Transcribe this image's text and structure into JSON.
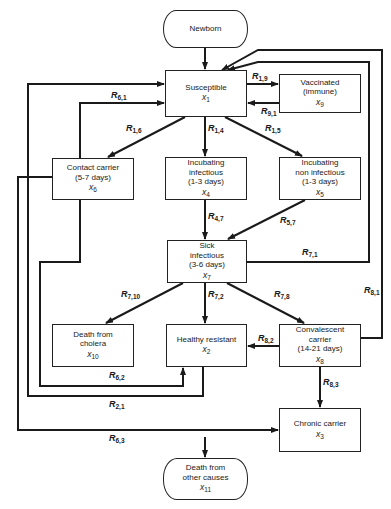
{
  "diagram": {
    "type": "compartment-flow",
    "nodes": [
      {
        "id": "newborn",
        "label": "Newborn",
        "sub": "",
        "var": "",
        "var_sub": ""
      },
      {
        "id": "susceptible",
        "label": "Susceptible",
        "sub": "",
        "var": "x",
        "var_sub": "1"
      },
      {
        "id": "vaccinated",
        "label": "Vaccinated",
        "sub": "(immune)",
        "var": "x",
        "var_sub": "9"
      },
      {
        "id": "contact",
        "label": "Contact carrier",
        "sub": "(5-7 days)",
        "var": "x",
        "var_sub": "6"
      },
      {
        "id": "incub_inf",
        "label": "Incubating",
        "label2": "infectious",
        "sub": "(1-3 days)",
        "var": "x",
        "var_sub": "4"
      },
      {
        "id": "incub_noninf",
        "label": "Incubating",
        "label2": "non infectious",
        "sub": "(1-3 days)",
        "var": "x",
        "var_sub": "5"
      },
      {
        "id": "sick",
        "label": "Sick",
        "label2": "infectious",
        "sub": "(3-6 days)",
        "var": "x",
        "var_sub": "7"
      },
      {
        "id": "death_cholera",
        "label": "Death from",
        "label2": "cholera",
        "sub": "",
        "var": "x",
        "var_sub": "10"
      },
      {
        "id": "healthy",
        "label": "Healthy resistant",
        "sub": "",
        "var": "x",
        "var_sub": "2"
      },
      {
        "id": "convalescent",
        "label": "Convalescent",
        "label2": "carrier",
        "sub": "(14-21 days)",
        "var": "x",
        "var_sub": "8"
      },
      {
        "id": "chronic",
        "label": "Chronic carrier",
        "sub": "",
        "var": "x",
        "var_sub": "3"
      },
      {
        "id": "death_other",
        "label": "Death from",
        "label2": "other causes",
        "sub": "",
        "var": "x",
        "var_sub": "11"
      }
    ],
    "edges": [
      {
        "from": "newborn",
        "to": "susceptible",
        "label": "",
        "sub": ""
      },
      {
        "from": "susceptible",
        "to": "vaccinated",
        "label": "R",
        "sub": "1,9"
      },
      {
        "from": "vaccinated",
        "to": "susceptible",
        "label": "R",
        "sub": "9,1"
      },
      {
        "from": "susceptible",
        "to": "contact",
        "label": "R",
        "sub": "1,6"
      },
      {
        "from": "susceptible",
        "to": "incub_inf",
        "label": "R",
        "sub": "1,4"
      },
      {
        "from": "susceptible",
        "to": "incub_noninf",
        "label": "R",
        "sub": "1,5"
      },
      {
        "from": "contact",
        "to": "susceptible",
        "label": "R",
        "sub": "6,1"
      },
      {
        "from": "incub_inf",
        "to": "sick",
        "label": "R",
        "sub": "4,7"
      },
      {
        "from": "incub_noninf",
        "to": "sick",
        "label": "R",
        "sub": "5,7"
      },
      {
        "from": "sick",
        "to": "susceptible",
        "label": "R",
        "sub": "7,1"
      },
      {
        "from": "convalescent",
        "to": "susceptible",
        "label": "R",
        "sub": "8,1"
      },
      {
        "from": "sick",
        "to": "death_cholera",
        "label": "R",
        "sub": "7,10"
      },
      {
        "from": "sick",
        "to": "healthy",
        "label": "R",
        "sub": "7,2"
      },
      {
        "from": "sick",
        "to": "convalescent",
        "label": "R",
        "sub": "7,8"
      },
      {
        "from": "convalescent",
        "to": "healthy",
        "label": "R",
        "sub": "8,2"
      },
      {
        "from": "contact",
        "to": "healthy",
        "label": "R",
        "sub": "6,2"
      },
      {
        "from": "healthy",
        "to": "susceptible",
        "label": "R",
        "sub": "2,1"
      },
      {
        "from": "convalescent",
        "to": "chronic",
        "label": "R",
        "sub": "8,3"
      },
      {
        "from": "contact",
        "to": "chronic",
        "label": "R",
        "sub": "6,3"
      },
      {
        "from": "population",
        "to": "death_other",
        "label": "",
        "sub": ""
      }
    ]
  }
}
